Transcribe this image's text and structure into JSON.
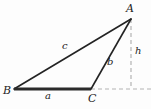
{
  "figure": {
    "type": "geometry-diagram",
    "width": 151,
    "height": 109,
    "background_color": "#fdfdfd",
    "stroke_color": "#232323",
    "dashed_color": "#b4b4b4",
    "vertices": [
      {
        "id": "A",
        "label": "A",
        "x": 131,
        "y": 19
      },
      {
        "id": "B",
        "label": "B",
        "x": 14,
        "y": 89
      },
      {
        "id": "C",
        "label": "C",
        "x": 91,
        "y": 89
      }
    ],
    "sides": [
      {
        "id": "a",
        "label": "a",
        "from": "B",
        "to": "C",
        "style": "solid-thick",
        "stroke_width": 2.6
      },
      {
        "id": "b",
        "label": "b",
        "from": "C",
        "to": "A",
        "style": "solid",
        "stroke_width": 1.5
      },
      {
        "id": "c",
        "label": "c",
        "from": "B",
        "to": "A",
        "style": "solid",
        "stroke_width": 1.5
      }
    ],
    "altitude": {
      "id": "h",
      "label": "h",
      "from_x": 131,
      "from_y": 19,
      "to_x": 131,
      "to_y": 89,
      "style": "dashed"
    },
    "baseline_extension": {
      "id": "base-extension",
      "from_x": 91,
      "from_y": 89,
      "to_x": 151,
      "to_y": 89,
      "style": "dashed"
    }
  }
}
